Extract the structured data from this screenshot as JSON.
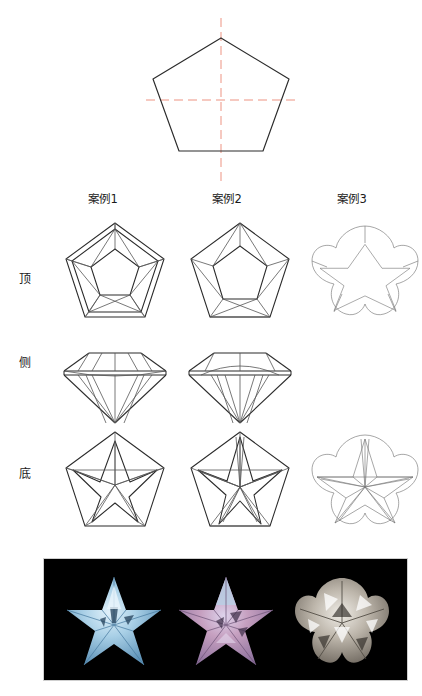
{
  "figure": {
    "title_visible": false,
    "type": "gemstone-faceting-reference"
  },
  "construction": {
    "shape_name": "pentagon",
    "centerline_color": "#e8705a",
    "outline_color": "#2b2b2b",
    "vertical_axis_label": "",
    "horizontal_axis_label": ""
  },
  "columns": [
    {
      "id": "case1",
      "label": "案例1"
    },
    {
      "id": "case2",
      "label": "案例2"
    },
    {
      "id": "case3",
      "label": "案例3"
    }
  ],
  "rows": [
    {
      "id": "top",
      "label": "顶"
    },
    {
      "id": "side",
      "label": "侧"
    },
    {
      "id": "bottom",
      "label": "底"
    }
  ],
  "cells": {
    "case1": {
      "top": {
        "present": true,
        "outline": "pentagon",
        "facets": "pentagon-table-with-crown-facets"
      },
      "side": {
        "present": true,
        "outline": "brilliant-profile",
        "facets": "crown-girdle-pavilion"
      },
      "bottom": {
        "present": true,
        "outline": "pentagon",
        "facets": "five-point-star-pavilion"
      }
    },
    "case2": {
      "top": {
        "present": true,
        "outline": "pentagon",
        "facets": "pentagon-table-with-crown-facets"
      },
      "side": {
        "present": true,
        "outline": "brilliant-profile",
        "facets": "crown-girdle-pavilion"
      },
      "bottom": {
        "present": true,
        "outline": "pentagon",
        "facets": "five-point-star-pavilion-dense"
      }
    },
    "case3": {
      "top": {
        "present": true,
        "outline": "scalloped-flower",
        "facets": "star-table"
      },
      "side": {
        "present": false,
        "outline": "",
        "facets": ""
      },
      "bottom": {
        "present": true,
        "outline": "scalloped-flower",
        "facets": "radiating-star-pavilion"
      }
    }
  },
  "photo": {
    "background_color": "#000000",
    "border_color": "#cfcfcf",
    "gems": [
      {
        "id": "gem-blue",
        "shape": "star",
        "color": "#a8cfe6",
        "accent": "#5f93b8",
        "highlight": "#e2f1fa"
      },
      {
        "id": "gem-pink",
        "shape": "star",
        "color": "#c6a0c0",
        "accent": "#8a6f9b",
        "highlight": "#ddd3ec"
      },
      {
        "id": "gem-clear",
        "shape": "flower",
        "color": "#bdb6ab",
        "accent": "#7a736a",
        "highlight": "#efece6"
      }
    ]
  }
}
